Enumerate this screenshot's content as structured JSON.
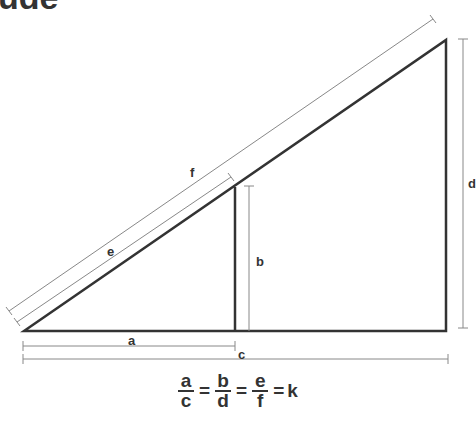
{
  "title_fragment": "ude",
  "labels": {
    "a": "a",
    "b": "b",
    "c": "c",
    "d": "d",
    "e": "e",
    "f": "f"
  },
  "formula": {
    "fractions": [
      {
        "num": "a",
        "den": "c"
      },
      {
        "num": "b",
        "den": "d"
      },
      {
        "num": "e",
        "den": "f"
      }
    ],
    "equals": "=",
    "result": "k"
  },
  "colors": {
    "stroke": "#333333",
    "dim": "#888888"
  }
}
